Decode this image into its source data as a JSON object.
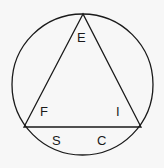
{
  "figure": {
    "type": "geometry-diagram",
    "background_color": "#f7f7f7",
    "stroke_color": "#1a1a1a",
    "label_color": "#1a1a1a",
    "canvas": {
      "width": 164,
      "height": 168
    },
    "circle": {
      "name": "circumscribed-circle",
      "cx": 82.5,
      "cy": 84.5,
      "r": 70.5,
      "stroke_width": 1.3,
      "fill": "none"
    },
    "triangle": {
      "name": "inscribed-triangle",
      "stroke_width": 1.3,
      "fill": "none",
      "vertices": [
        {
          "id": "apex",
          "x": 83,
          "y": 14
        },
        {
          "id": "bottom-left",
          "x": 24,
          "y": 127
        },
        {
          "id": "bottom-right",
          "x": 141,
          "y": 127
        }
      ],
      "points_attr": "83,14 24,127 141,127"
    },
    "labels": [
      {
        "id": "E",
        "text": "E",
        "x": 77,
        "y": 31,
        "position": "apex-interior"
      },
      {
        "id": "F",
        "text": "F",
        "x": 40,
        "y": 105,
        "position": "bottom-left-interior"
      },
      {
        "id": "I",
        "text": "I",
        "x": 116,
        "y": 105,
        "position": "bottom-right-interior"
      },
      {
        "id": "S",
        "text": "S",
        "x": 52,
        "y": 134,
        "position": "below-base-left"
      },
      {
        "id": "C",
        "text": "C",
        "x": 97,
        "y": 134,
        "position": "below-base-right"
      }
    ],
    "label_E": "E",
    "label_F": "F",
    "label_I": "I",
    "label_S": "S",
    "label_C": "C"
  }
}
